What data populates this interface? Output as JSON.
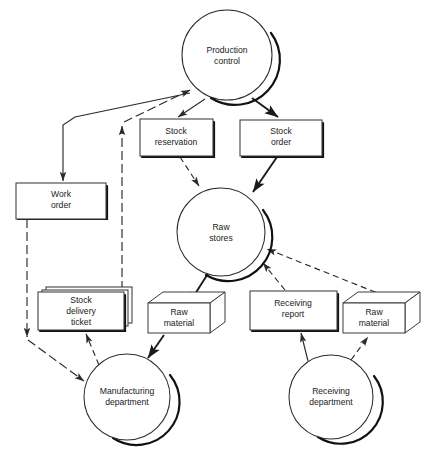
{
  "diagram": {
    "background_color": "#ffffff",
    "line_color": "#2b2b2b",
    "nodes": {
      "production_control": {
        "label_line1": "Production",
        "label_line2": "control",
        "shape": "circle"
      },
      "stock_reservation": {
        "label_line1": "Stock",
        "label_line2": "reservation",
        "shape": "rectangle"
      },
      "stock_order": {
        "label_line1": "Stock",
        "label_line2": "order",
        "shape": "rectangle"
      },
      "work_order": {
        "label_line1": "Work",
        "label_line2": "order",
        "shape": "rectangle"
      },
      "raw_stores": {
        "label_line1": "Raw",
        "label_line2": "stores",
        "shape": "circle"
      },
      "stock_delivery_ticket": {
        "label_line1": "Stock",
        "label_line2": "delivery",
        "label_line3": "ticket",
        "shape": "stacked-rectangle"
      },
      "raw_material_left": {
        "label_line1": "Raw",
        "label_line2": "material",
        "shape": "isometric-box"
      },
      "receiving_report": {
        "label_line1": "Receiving",
        "label_line2": "report",
        "shape": "rectangle"
      },
      "raw_material_right": {
        "label_line1": "Raw",
        "label_line2": "material",
        "shape": "isometric-box"
      },
      "manufacturing_department": {
        "label_line1": "Manufacturing",
        "label_line2": "department",
        "shape": "circle"
      },
      "receiving_department": {
        "label_line1": "Receiving",
        "label_line2": "department",
        "shape": "circle"
      }
    },
    "edges": [
      {
        "id": "pc-to-work-order",
        "from": "production_control",
        "to": "work_order",
        "style": "solid"
      },
      {
        "id": "pc-to-stock-reservation",
        "from": "production_control",
        "to": "stock_reservation",
        "style": "thin"
      },
      {
        "id": "pc-to-stock-order",
        "from": "production_control",
        "to": "stock_order",
        "style": "solid"
      },
      {
        "id": "stock-reservation-to-raw-stores",
        "from": "stock_reservation",
        "to": "raw_stores",
        "style": "dashed"
      },
      {
        "id": "stock-order-to-raw-stores",
        "from": "stock_order",
        "to": "raw_stores",
        "style": "solid"
      },
      {
        "id": "work-order-to-manufacturing",
        "from": "work_order",
        "to": "manufacturing_department",
        "style": "dash-dot"
      },
      {
        "id": "raw-stores-to-raw-material-left",
        "from": "raw_stores",
        "to": "raw_material_left",
        "style": "solid"
      },
      {
        "id": "raw-material-left-to-manufacturing",
        "from": "raw_material_left",
        "to": "manufacturing_department",
        "style": "solid"
      },
      {
        "id": "manufacturing-to-stock-delivery-ticket",
        "from": "manufacturing_department",
        "to": "stock_delivery_ticket",
        "style": "dashed"
      },
      {
        "id": "stock-delivery-ticket-to-pc",
        "from": "stock_delivery_ticket",
        "to": "production_control",
        "style": "dash-dot"
      },
      {
        "id": "receiving-to-receiving-report",
        "from": "receiving_department",
        "to": "receiving_report",
        "style": "thin"
      },
      {
        "id": "receiving-to-raw-material-right",
        "from": "receiving_department",
        "to": "raw_material_right",
        "style": "dashed"
      },
      {
        "id": "receiving-report-to-raw-stores",
        "from": "receiving_report",
        "to": "raw_stores",
        "style": "dashed"
      },
      {
        "id": "raw-material-right-to-raw-stores",
        "from": "raw_material_right",
        "to": "raw_stores",
        "style": "dashed"
      }
    ]
  }
}
